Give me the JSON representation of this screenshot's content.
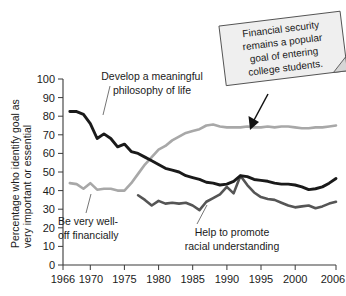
{
  "chart_data": {
    "type": "line",
    "title": "",
    "xlabel": "",
    "ylabel": "Percentage who identify goal as very important or essential",
    "xlim": [
      1966,
      2006
    ],
    "ylim": [
      0,
      100
    ],
    "grid": false,
    "legend_position": "inline-labels",
    "xticks": [
      "1966",
      "1970",
      "1975",
      "1980",
      "1985",
      "1990",
      "1995",
      "2000",
      "2006"
    ],
    "xtick_values": [
      1966,
      1970,
      1975,
      1980,
      1985,
      1990,
      1995,
      2000,
      2006
    ],
    "yticks": [
      "0",
      "10",
      "20",
      "30",
      "40",
      "50",
      "60",
      "70",
      "80",
      "90",
      "100"
    ],
    "ytick_values": [
      0,
      10,
      20,
      30,
      40,
      50,
      60,
      70,
      80,
      90,
      100
    ],
    "series": [
      {
        "name": "Develop a meaningful philosophy of life",
        "color": "#1a1a1a",
        "x": [
          1967,
          1968,
          1969,
          1970,
          1971,
          1972,
          1973,
          1974,
          1975,
          1976,
          1977,
          1978,
          1979,
          1980,
          1981,
          1982,
          1983,
          1984,
          1985,
          1986,
          1987,
          1988,
          1989,
          1990,
          1991,
          1992,
          1993,
          1994,
          1995,
          1996,
          1997,
          1998,
          1999,
          2000,
          2001,
          2002,
          2003,
          2004,
          2005,
          2006
        ],
        "values": [
          82.5,
          82.5,
          81,
          76,
          68,
          70.5,
          68,
          63.5,
          65,
          61,
          60,
          58,
          56,
          54,
          52,
          51,
          50,
          48,
          47,
          46,
          44.5,
          44,
          43,
          43.5,
          45,
          48,
          47.5,
          46,
          45.5,
          45,
          44,
          43.5,
          43.5,
          43,
          42,
          40.5,
          41,
          42,
          44,
          46.5
        ]
      },
      {
        "name": "Be very well-off financially",
        "color": "#a8a8a8",
        "x": [
          1967,
          1968,
          1969,
          1970,
          1971,
          1972,
          1973,
          1974,
          1975,
          1976,
          1977,
          1978,
          1979,
          1980,
          1981,
          1982,
          1983,
          1984,
          1985,
          1986,
          1987,
          1988,
          1989,
          1990,
          1991,
          1992,
          1993,
          1994,
          1995,
          1996,
          1997,
          1998,
          1999,
          2000,
          2001,
          2002,
          2003,
          2004,
          2005,
          2006
        ],
        "values": [
          44,
          43.5,
          41,
          44,
          40.5,
          41,
          41,
          40,
          40,
          44,
          49,
          54,
          58,
          62,
          64,
          67,
          69,
          71,
          72,
          73,
          75,
          75.5,
          74.5,
          74,
          74,
          74,
          74.5,
          74,
          74,
          74.5,
          74,
          74.5,
          74.5,
          74,
          73.5,
          73.5,
          74,
          74,
          74.5,
          75
        ]
      },
      {
        "name": "Help to promote racial understanding",
        "color": "#555555",
        "x": [
          1977,
          1978,
          1979,
          1980,
          1981,
          1982,
          1983,
          1984,
          1985,
          1986,
          1987,
          1988,
          1989,
          1990,
          1991,
          1992,
          1993,
          1994,
          1995,
          1996,
          1997,
          1998,
          1999,
          2000,
          2001,
          2002,
          2003,
          2004,
          2005,
          2006
        ],
        "values": [
          37.5,
          35,
          32,
          34.5,
          33,
          33.5,
          33,
          33.5,
          32,
          29.5,
          34,
          36,
          38,
          42,
          38.5,
          48,
          43,
          39,
          36.5,
          35.5,
          35,
          33.5,
          32,
          31,
          31.5,
          32,
          30.5,
          31.5,
          33,
          34
        ]
      }
    ],
    "annotations": [
      {
        "name": "philosophy-label",
        "text_lines": [
          "Develop a meaningful",
          "philosophy of life"
        ],
        "points_to": [
          1972,
          70
        ]
      },
      {
        "name": "financial-label",
        "text_lines": [
          "Be very well-",
          "off financially"
        ],
        "points_to": [
          1971,
          41
        ]
      },
      {
        "name": "racial-label",
        "text_lines": [
          "Help to promote",
          "racial understanding"
        ],
        "points_to": [
          1987,
          34
        ]
      }
    ],
    "callout": {
      "lines": [
        "Financial security",
        "remains a popular",
        "goal of entering",
        "college students."
      ],
      "points_to": [
        1998,
        74
      ]
    }
  }
}
